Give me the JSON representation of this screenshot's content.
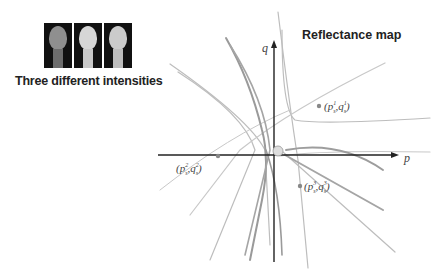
{
  "left_panel": {
    "caption": "Three different intensities",
    "images": [
      {
        "name": "head-light-1",
        "shade": "#8a8a8a"
      },
      {
        "name": "head-light-2",
        "shade": "#cfcfcf"
      },
      {
        "name": "head-light-3",
        "shade": "#c4c4c4"
      }
    ]
  },
  "reflectance_map": {
    "title": "Reflectance map",
    "axes": {
      "x_label": "p",
      "y_label": "q"
    },
    "points": [
      {
        "label_base": "(p",
        "sup1": "1",
        "sub": "s",
        "mid": ",q",
        "sup2": "1",
        "sub2": "s",
        "close": ")"
      },
      {
        "label_base": "(p",
        "sup1": "2",
        "sub": "s",
        "mid": ",q",
        "sup2": "2",
        "sub2": "s",
        "close": ")"
      },
      {
        "label_base": "(p",
        "sup1": "3",
        "sub": "s",
        "mid": ",q",
        "sup2": "3",
        "sub2": "s",
        "close": ")"
      }
    ],
    "colors": {
      "axis": "#222222",
      "curve_light": "#bdbdbd",
      "curve_dark": "#8f8f8f",
      "origin_fill": "#dddddd"
    }
  }
}
